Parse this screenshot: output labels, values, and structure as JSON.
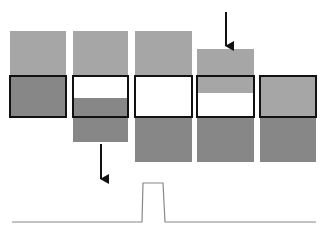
{
  "diagram": {
    "title": "",
    "colors": {
      "light": "#a6a6a6",
      "dark": "#878787",
      "white": "#ffffff",
      "outline": "#111111",
      "signal": "#888888",
      "arrow": "#111111"
    },
    "columns": [
      {
        "id": "column-1",
        "x": 10,
        "w": 56,
        "segments": [
          {
            "y": 31,
            "h": 44,
            "fill": "light"
          },
          {
            "y": 75,
            "h": 43,
            "fill": "dark"
          }
        ],
        "window": {
          "y": 75,
          "h": 43
        }
      },
      {
        "id": "column-2",
        "x": 73,
        "w": 55,
        "segments": [
          {
            "y": 31,
            "h": 44,
            "fill": "light"
          },
          {
            "y": 75,
            "h": 23,
            "fill": "white"
          },
          {
            "y": 98,
            "h": 44,
            "fill": "dark"
          }
        ],
        "window": {
          "y": 75,
          "h": 43
        }
      },
      {
        "id": "column-3",
        "x": 135,
        "w": 57,
        "segments": [
          {
            "y": 31,
            "h": 44,
            "fill": "light"
          },
          {
            "y": 75,
            "h": 43,
            "fill": "white"
          },
          {
            "y": 118,
            "h": 44,
            "fill": "dark"
          }
        ],
        "window": {
          "y": 75,
          "h": 43
        }
      },
      {
        "id": "column-4",
        "x": 197,
        "w": 57,
        "segments": [
          {
            "y": 49,
            "h": 44,
            "fill": "light"
          },
          {
            "y": 93,
            "h": 25,
            "fill": "white"
          },
          {
            "y": 118,
            "h": 44,
            "fill": "dark"
          }
        ],
        "window": {
          "y": 75,
          "h": 43
        }
      },
      {
        "id": "column-5",
        "x": 260,
        "w": 56,
        "segments": [
          {
            "y": 75,
            "h": 43,
            "fill": "light"
          },
          {
            "y": 118,
            "h": 44,
            "fill": "dark"
          }
        ],
        "window": {
          "y": 75,
          "h": 43
        }
      }
    ],
    "arrows": [
      {
        "id": "arrow-down-column-4",
        "x": 226,
        "y1": 12,
        "y2": 46
      },
      {
        "id": "arrow-down-column-2",
        "x": 101,
        "y1": 144,
        "y2": 179
      }
    ],
    "signal": {
      "baseline_y": 222,
      "high_y": 183,
      "x_start": 12,
      "x_rise": 142,
      "x_rise_top": 143,
      "x_fall_top": 163,
      "x_fall": 165,
      "x_end": 316
    }
  }
}
